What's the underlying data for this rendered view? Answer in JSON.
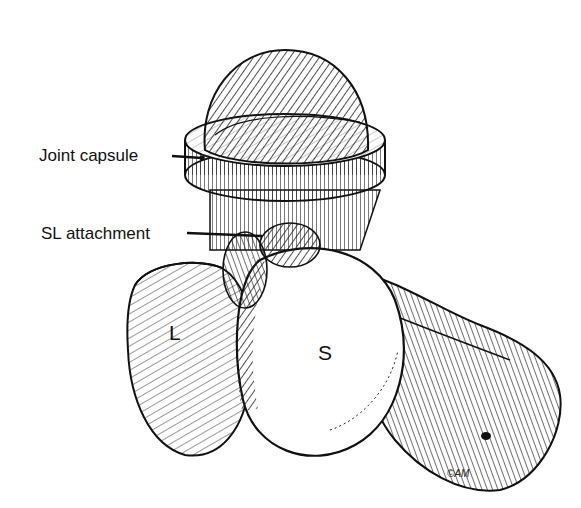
{
  "figure": {
    "labels": {
      "joint_capsule": "Joint capsule",
      "sl_attachment": "SL attachment",
      "L": "L",
      "S": "S"
    },
    "signature": "©AM"
  }
}
